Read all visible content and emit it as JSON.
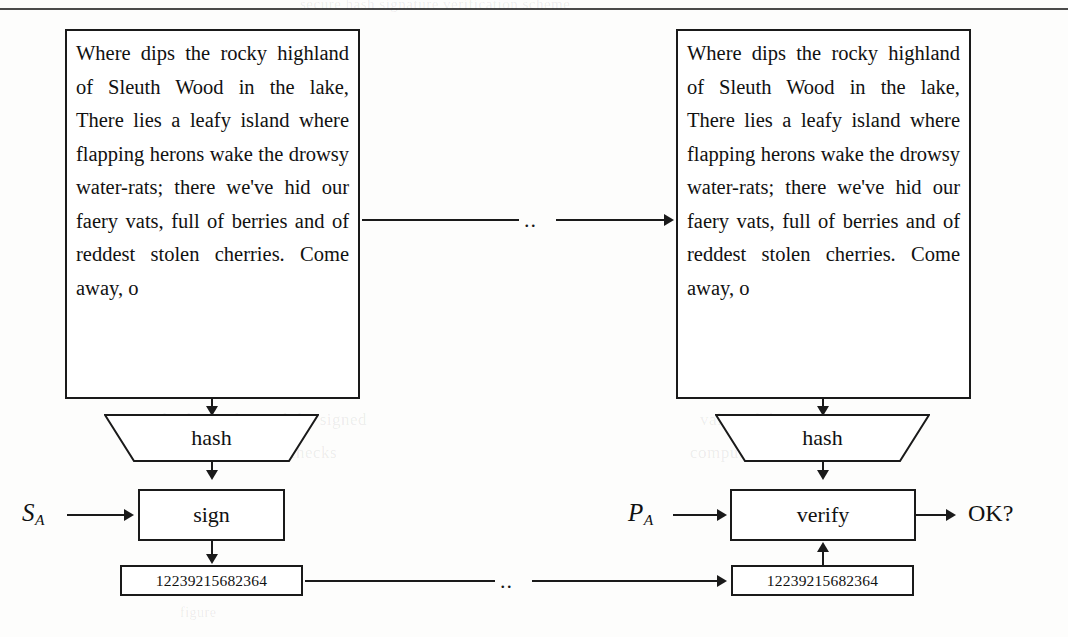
{
  "figure": {
    "kind": "digital-signature-flow-diagram",
    "message_text": "Where dips the rocky highland of Sleuth Wood in the lake, There lies a leafy island where flapping herons wake the drowsy water-rats; there we've hid our faery vats, full of berries and of reddest stolen cherries. Come away, o",
    "ellipsis": "..",
    "ink_color": "#1a1a1a",
    "paper_color": "#fdfdfc"
  },
  "left_column": {
    "name": "signing",
    "message_box_label": "Where dips the rocky highland of Sleuth Wood in the lake, There lies a leafy island where flapping herons wake the drowsy water-rats; there we've hid our faery vats, full of berries and of reddest stolen cherries. Come away, o",
    "hash_label": "hash",
    "operation_label": "sign",
    "key_label": "S",
    "key_subscript": "A",
    "signature_value": "12239215682364"
  },
  "right_column": {
    "name": "verification",
    "message_box_label": "Where dips the rocky highland of Sleuth Wood in the lake, There lies a leafy island where flapping herons wake the drowsy water-rats; there we've hid our faery vats, full of berries and of reddest stolen cherries. Come away, o",
    "hash_label": "hash",
    "operation_label": "verify",
    "key_label": "P",
    "key_subscript": "A",
    "signature_value": "12239215682364",
    "result_label": "OK?"
  },
  "connectors": {
    "message_transfer_marker": "..",
    "signature_transfer_marker": ".."
  },
  "ghost_bleed": {
    "line_top": "scanned page bleed-through",
    "mid_left": "artifact",
    "mid_right": "artifact"
  }
}
